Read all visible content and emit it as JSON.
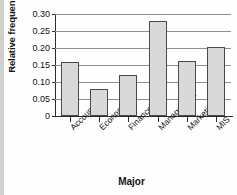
{
  "chart_data": {
    "type": "bar",
    "title": "",
    "xlabel": "Major",
    "ylabel": "Relative frequency",
    "categories": [
      "Accounting",
      "Economics",
      "Finance",
      "Management",
      "Marketing",
      "MIS"
    ],
    "values": [
      0.16,
      0.08,
      0.12,
      0.28,
      0.162,
      0.202
    ],
    "ylim": [
      0,
      0.3
    ],
    "yticks": [
      "0",
      "0.05",
      "0.10",
      "0.15",
      "0.20",
      "0.25",
      "0.30"
    ],
    "ytick_values": [
      0,
      0.05,
      0.1,
      0.15,
      0.2,
      0.25,
      0.3
    ],
    "grid": true,
    "legend": "none",
    "bar_fill": "#d9d9d9",
    "bar_edge": "#4a4a4a",
    "axis_color": "#2b2b2b",
    "grid_color": "#8e8e8e"
  }
}
